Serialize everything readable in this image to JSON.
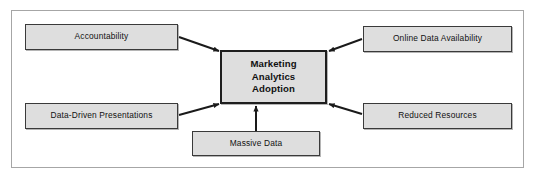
{
  "diagram": {
    "type": "hub-and-spoke concept diagram",
    "title_node": {
      "id": "central",
      "lines": [
        "Marketing",
        "Analytics",
        "Adoption"
      ],
      "text": "Marketing Analytics Adoption"
    },
    "nodes": [
      {
        "id": "accountability",
        "label": "Accountability",
        "position": "top-left"
      },
      {
        "id": "online-data-availability",
        "label": "Online Data Availability",
        "position": "top-right"
      },
      {
        "id": "data-driven-presentations",
        "label": "Data-Driven Presentations",
        "position": "bottom-left"
      },
      {
        "id": "reduced-resources",
        "label": "Reduced Resources",
        "position": "bottom-right"
      },
      {
        "id": "massive-data",
        "label": "Massive Data",
        "position": "bottom-center"
      }
    ],
    "connectors": [
      {
        "from": "accountability",
        "to": "central",
        "arrowhead": "at-central"
      },
      {
        "from": "online-data-availability",
        "to": "central",
        "arrowhead": "at-central"
      },
      {
        "from": "data-driven-presentations",
        "to": "central",
        "arrowhead": "at-central"
      },
      {
        "from": "reduced-resources",
        "to": "central",
        "arrowhead": "at-central"
      },
      {
        "from": "massive-data",
        "to": "central",
        "arrowhead": "at-central"
      }
    ],
    "colors": {
      "node_fill": "#dedede",
      "node_border": "#3a3a3a",
      "central_border": "#1e1e1e",
      "connector": "#1a1a1a",
      "frame_border": "#a6a6a6",
      "background": "#ffffff",
      "text": "#111111"
    }
  }
}
